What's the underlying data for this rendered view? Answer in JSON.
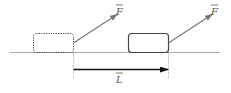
{
  "diagram": {
    "labels": {
      "force_initial": "F",
      "force_final": "F",
      "displacement": "L"
    },
    "colors": {
      "ground": "#aaaaaa",
      "box": "#444444",
      "force_arrow": "#777777",
      "displacement_arrow": "#111111",
      "guide": "#aaaaaa"
    }
  }
}
